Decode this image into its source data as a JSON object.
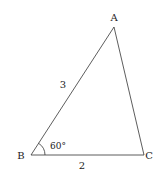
{
  "diagram": {
    "type": "triangle",
    "vertices": {
      "A": {
        "label": "A",
        "x": 114,
        "y": 27,
        "label_x": 114,
        "label_y": 21
      },
      "B": {
        "label": "B",
        "x": 31,
        "y": 155,
        "label_x": 21,
        "label_y": 159
      },
      "C": {
        "label": "C",
        "x": 144,
        "y": 155,
        "label_x": 149,
        "label_y": 159
      }
    },
    "sides": {
      "AB": {
        "label": "3",
        "x": 63,
        "y": 88
      },
      "BC": {
        "label": "2",
        "x": 82,
        "y": 169
      }
    },
    "angle": {
      "vertex": "B",
      "label": "60°",
      "x": 58,
      "y": 149
    },
    "colors": {
      "stroke": "#333333",
      "text": "#222222",
      "background": "#ffffff"
    }
  }
}
